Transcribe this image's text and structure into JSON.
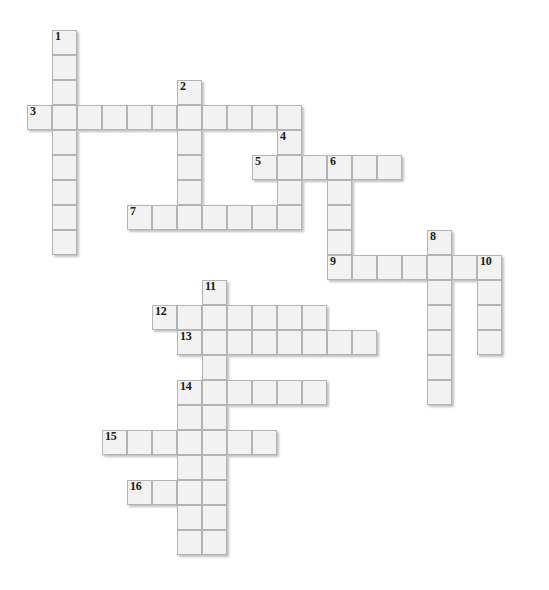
{
  "puzzle": {
    "title": "Crossword Puzzle Grid",
    "cell_size": 25,
    "origin_x": 27,
    "origin_y": 30,
    "grid_columns": 21,
    "grid_rows": 22,
    "colors": {
      "cell_fill": "#f2f2f2",
      "cell_border": "#b4b4b4",
      "page_background": "#ffffff",
      "number_color": "#1a1a1a",
      "shadow": "rgba(140,140,140,0.55)"
    },
    "entries": [
      {
        "number": "1",
        "direction": "down",
        "col": 1,
        "row": 0,
        "length": 9
      },
      {
        "number": "2",
        "direction": "down",
        "col": 6,
        "row": 2,
        "length": 6
      },
      {
        "number": "3",
        "direction": "across",
        "col": 0,
        "row": 3,
        "length": 11
      },
      {
        "number": "4",
        "direction": "down",
        "col": 10,
        "row": 4,
        "length": 4
      },
      {
        "number": "5",
        "direction": "across",
        "col": 9,
        "row": 5,
        "length": 6
      },
      {
        "number": "6",
        "direction": "down",
        "col": 12,
        "row": 5,
        "length": 5
      },
      {
        "number": "7",
        "direction": "across",
        "col": 4,
        "row": 7,
        "length": 7
      },
      {
        "number": "8",
        "direction": "down",
        "col": 16,
        "row": 8,
        "length": 7
      },
      {
        "number": "9",
        "direction": "across",
        "col": 12,
        "row": 9,
        "length": 7
      },
      {
        "number": "10",
        "direction": "down",
        "col": 18,
        "row": 9,
        "length": 4
      },
      {
        "number": "11",
        "direction": "down",
        "col": 7,
        "row": 10,
        "length": 11
      },
      {
        "number": "12",
        "direction": "across",
        "col": 5,
        "row": 11,
        "length": 7
      },
      {
        "number": "13",
        "direction": "across",
        "col": 6,
        "row": 12,
        "length": 8
      },
      {
        "number": "14",
        "direction": "across",
        "col": 6,
        "row": 14,
        "length": 6
      },
      {
        "number": "14",
        "direction": "down",
        "col": 6,
        "row": 14,
        "length": 7
      },
      {
        "number": "15",
        "direction": "across",
        "col": 3,
        "row": 16,
        "length": 7
      },
      {
        "number": "16",
        "direction": "across",
        "col": 4,
        "row": 18,
        "length": 4
      }
    ],
    "numbered_labels": [
      "1",
      "2",
      "3",
      "4",
      "5",
      "6",
      "7",
      "8",
      "9",
      "10",
      "11",
      "12",
      "13",
      "14",
      "15",
      "16"
    ]
  }
}
